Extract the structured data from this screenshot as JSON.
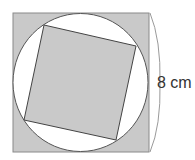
{
  "diagram": {
    "outer_square": {
      "x": 13,
      "y": 13,
      "width": 136,
      "height": 139,
      "fill": "#c9c9c9",
      "stroke": "#8a8a8a"
    },
    "circle": {
      "cx": 80.5,
      "cy": 82.5,
      "rx": 67.5,
      "ry": 69,
      "fill": "#ffffff",
      "stroke": "#555555"
    },
    "inner_square": {
      "points": "44,25 136,46 116,140 24,120",
      "fill": "#c9c9c9",
      "stroke": "#444444"
    },
    "brace": {
      "path": "M150,13 Q161,40 160,83 Q161,126 150,152",
      "stroke": "#9a9a9a"
    },
    "dimension_label": "8 cm"
  }
}
